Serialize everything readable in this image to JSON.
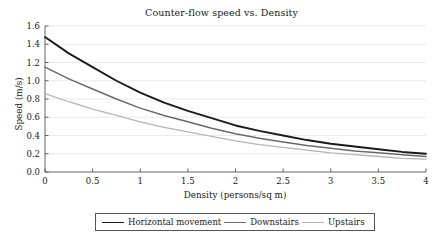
{
  "chart_data": {
    "type": "line",
    "title": "Counter-flow speed vs. Density",
    "xlabel": "Density (persons/sq m)",
    "ylabel": "Speed (m/s)",
    "xlim": [
      0,
      4
    ],
    "ylim": [
      0.0,
      1.6
    ],
    "grid": true,
    "grid_axis": "y",
    "legend_position": "below-center",
    "x": [
      0,
      0.25,
      0.5,
      0.75,
      1,
      1.25,
      1.5,
      1.75,
      2,
      2.25,
      2.5,
      2.75,
      3,
      3.25,
      3.5,
      3.75,
      4
    ],
    "xticks": [
      0,
      0.5,
      1,
      1.5,
      2,
      2.5,
      3,
      3.5,
      4
    ],
    "xtick_labels": [
      "0",
      "0.5",
      "1",
      "1.5",
      "2",
      "2.5",
      "3",
      "3.5",
      "4"
    ],
    "yticks": [
      0.0,
      0.2,
      0.4,
      0.6,
      0.8,
      1.0,
      1.2,
      1.4,
      1.6
    ],
    "ytick_labels": [
      "0.0",
      "0.2",
      "0.4",
      "0.6",
      "0.8",
      "1.0",
      "1.2",
      "1.4",
      "1.6"
    ],
    "series": [
      {
        "name": "Horizontal movement",
        "color": "#1a1a1a",
        "width": 1.9,
        "values": [
          1.48,
          1.3,
          1.15,
          1.0,
          0.87,
          0.76,
          0.67,
          0.59,
          0.51,
          0.45,
          0.4,
          0.35,
          0.31,
          0.28,
          0.25,
          0.22,
          0.2
        ]
      },
      {
        "name": "Downstairs",
        "color": "#6a6a6a",
        "width": 1.5,
        "values": [
          1.15,
          1.02,
          0.91,
          0.8,
          0.7,
          0.62,
          0.55,
          0.48,
          0.42,
          0.37,
          0.33,
          0.29,
          0.26,
          0.23,
          0.21,
          0.19,
          0.17
        ]
      },
      {
        "name": "Upstairs",
        "color": "#b5b5b5",
        "width": 1.3,
        "values": [
          0.86,
          0.77,
          0.69,
          0.62,
          0.55,
          0.49,
          0.44,
          0.39,
          0.34,
          0.3,
          0.27,
          0.24,
          0.21,
          0.19,
          0.17,
          0.15,
          0.14
        ]
      }
    ]
  },
  "legend": {
    "items": [
      {
        "label": "Horizontal movement",
        "color": "#1a1a1a",
        "width": 1.9
      },
      {
        "label": "Downstairs",
        "color": "#6a6a6a",
        "width": 1.5
      },
      {
        "label": "Upstairs",
        "color": "#b5b5b5",
        "width": 1.3
      }
    ]
  },
  "style": {
    "axis_color": "#555555",
    "grid_color": "#e2e2e2",
    "background": "#ffffff"
  }
}
